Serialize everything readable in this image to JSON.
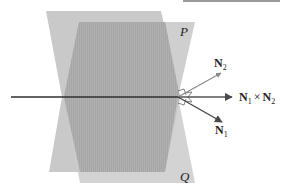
{
  "figure": {
    "type": "two intersecting planes with normal vectors and cross product",
    "colors": {
      "plane_p_fill": "#c8c8c8",
      "plane_q_fill": "#a9a9a9",
      "line_color": "#3a3a3a",
      "vector_color": "#555555"
    },
    "labels": {
      "plane_p": "P",
      "plane_q": "Q",
      "n2": {
        "base": "N",
        "sub": "2"
      },
      "n1": {
        "base": "N",
        "sub": "1"
      },
      "cross": {
        "a": "N",
        "a_sub": "1",
        "op": "×",
        "b": "N",
        "b_sub": "2"
      }
    }
  }
}
